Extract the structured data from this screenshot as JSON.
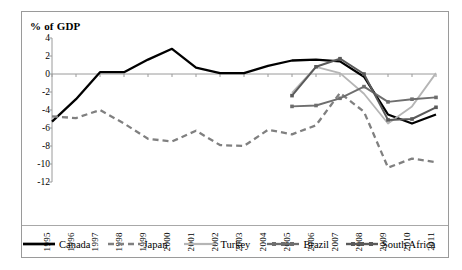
{
  "chart_data": {
    "type": "line",
    "title": "% of GDP",
    "xlabel": "",
    "ylabel": "% of GDP",
    "grid": false,
    "legend_position": "bottom",
    "x": [
      1995,
      1996,
      1997,
      1998,
      1999,
      2000,
      2001,
      2002,
      2003,
      2004,
      2005,
      2006,
      2007,
      2008,
      2009,
      2010,
      2011
    ],
    "xticklabels": [
      "1995",
      "1996",
      "1997",
      "1998",
      "1999",
      "2000",
      "2001",
      "2002",
      "2003",
      "2004",
      "2005",
      "2006",
      "2007",
      "2008",
      "2009",
      "2010",
      "2011"
    ],
    "ylim": [
      -12,
      4
    ],
    "yticks": [
      4,
      2,
      0,
      -2,
      -4,
      -6,
      -8,
      -10,
      -12
    ],
    "yticklabels": [
      "4",
      "2",
      "0",
      "-2",
      "-4",
      "-6",
      "-8",
      "-10",
      "-12"
    ],
    "series": [
      {
        "name": "Canada",
        "color": "#000000",
        "style": "solid",
        "marker": "none",
        "x": [
          1995,
          1996,
          1997,
          1998,
          1999,
          2000,
          2001,
          2002,
          2003,
          2004,
          2005,
          2006,
          2007,
          2008,
          2009,
          2010,
          2011
        ],
        "values": [
          -5.3,
          -2.8,
          0.2,
          0.2,
          1.6,
          2.8,
          0.7,
          0.1,
          0.1,
          0.9,
          1.5,
          1.6,
          1.4,
          -0.3,
          -4.5,
          -5.5,
          -4.5
        ]
      },
      {
        "name": "Japan",
        "color": "#808080",
        "style": "dashed",
        "marker": "none",
        "x": [
          1995,
          1996,
          1997,
          1998,
          1999,
          2000,
          2001,
          2002,
          2003,
          2004,
          2005,
          2006,
          2007,
          2008,
          2009,
          2010,
          2011
        ],
        "values": [
          -4.7,
          -4.9,
          -4.0,
          -5.5,
          -7.2,
          -7.5,
          -6.3,
          -7.9,
          -8.0,
          -6.2,
          -6.7,
          -5.7,
          -2.1,
          -4.2,
          -10.4,
          -9.4,
          -9.8
        ]
      },
      {
        "name": "Turkey",
        "color": "#b5b5b5",
        "style": "solid",
        "marker": "none",
        "x": [
          2005,
          2006,
          2007,
          2008,
          2009,
          2010,
          2011
        ],
        "values": [
          -2.1,
          0.8,
          0.1,
          -2.2,
          -5.5,
          -3.6,
          0.1
        ]
      },
      {
        "name": "Brazil",
        "color": "#6e6e6e",
        "style": "solid",
        "marker": "square",
        "x": [
          2005,
          2006,
          2007,
          2008,
          2009,
          2010,
          2011
        ],
        "values": [
          -3.6,
          -3.5,
          -2.7,
          -1.4,
          -3.1,
          -2.8,
          -2.6
        ]
      },
      {
        "name": "South Africa",
        "color": "#5a5a5a",
        "style": "solid",
        "marker": "square",
        "x": [
          2005,
          2006,
          2007,
          2008,
          2009,
          2010,
          2011
        ],
        "values": [
          -2.4,
          0.8,
          1.7,
          0.0,
          -5.1,
          -5.0,
          -3.7
        ]
      }
    ]
  },
  "legend": {
    "items": [
      {
        "label": "Canada",
        "swatch": "solid-black-line-swatch"
      },
      {
        "label": "Japan",
        "swatch": "dashed-gray-line-swatch"
      },
      {
        "label": "Turkey",
        "swatch": "light-gray-line-swatch"
      },
      {
        "label": "Brazil",
        "swatch": "gray-marker-line-swatch"
      },
      {
        "label": "South Africa",
        "swatch": "dark-gray-marker-line-swatch"
      }
    ]
  },
  "colors": {
    "canada": "#000000",
    "japan": "#808080",
    "turkey": "#b5b5b5",
    "brazil": "#6e6e6e",
    "south_africa": "#5a5a5a",
    "axis": "#9a9a9a",
    "border": "#9a9a9a",
    "background": "#ffffff"
  }
}
